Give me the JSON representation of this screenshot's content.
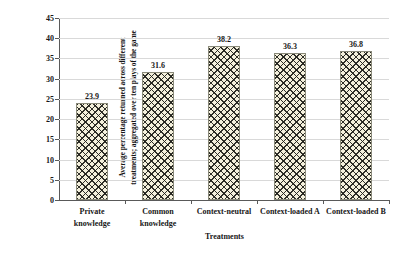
{
  "chart_data": {
    "type": "bar",
    "title": "",
    "categories": [
      "Private knowledge",
      "Common knowledge",
      "Context-neutral",
      "Context-loaded A",
      "Context-loaded B"
    ],
    "category_lines": [
      [
        "Private",
        "knowledge"
      ],
      [
        "Common",
        "knowledge"
      ],
      [
        "Context-neutral"
      ],
      [
        "Context-loaded A"
      ],
      [
        "Context-loaded B"
      ]
    ],
    "values": [
      23.9,
      31.6,
      38.2,
      36.3,
      36.8
    ],
    "value_labels": [
      "23.9",
      "31.6",
      "38.2",
      "36.3",
      "36.8"
    ],
    "xlabel": "Treatments",
    "ylabel_lines": [
      "Average percentage returned across different",
      "treatments; aggregated over ten plays of the game"
    ],
    "ylim": [
      0,
      45
    ],
    "yticks": [
      0,
      5,
      10,
      15,
      20,
      25,
      30,
      35,
      40,
      45
    ],
    "ytick_labels": [
      "0",
      "5",
      "10",
      "15",
      "20",
      "25",
      "30",
      "35",
      "40",
      "45"
    ],
    "grid": true,
    "legend": null,
    "colors": {
      "bar_fill": "#f4f0dc",
      "bar_hatch": "#1e1e19",
      "bar_border": "#8a8a7a",
      "gridline": "#d9d9d9",
      "axis": "#595959",
      "text": "#171717",
      "background": "#ffffff"
    }
  }
}
